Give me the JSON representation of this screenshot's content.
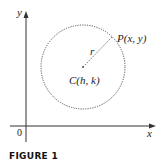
{
  "figure": {
    "caption": "FIGURE 1",
    "axes": {
      "x_label": "x",
      "y_label": "y",
      "origin_label": "0"
    },
    "circle": {
      "center_label": "C(h, k)",
      "point_label": "P(x, y)",
      "radius_label": "r"
    }
  }
}
